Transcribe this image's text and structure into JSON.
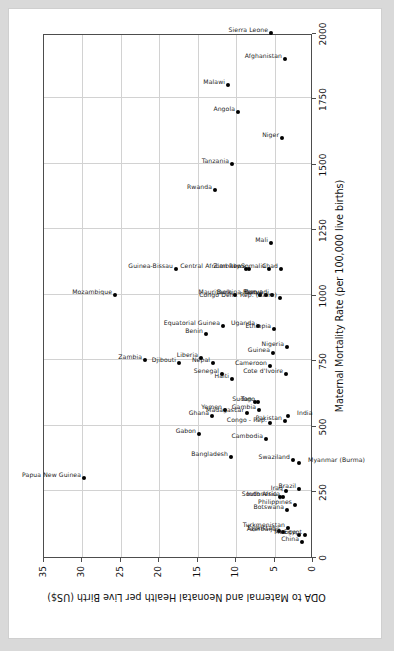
{
  "chart_data": {
    "type": "scatter",
    "title": "",
    "xlabel": "Maternal Mortality Rate (per 100,000 live births)",
    "ylabel": "ODA to Maternal and Neonatal Health per Live Birth (US$)",
    "xlim": [
      0,
      2000
    ],
    "ylim": [
      0,
      35
    ],
    "xticks": [
      0,
      250,
      500,
      750,
      1000,
      1250,
      1500,
      1750,
      2000
    ],
    "yticks": [
      0,
      5,
      10,
      15,
      20,
      25,
      30,
      35
    ],
    "grid": true,
    "legend": "none",
    "marker": "filled-diamond",
    "points": [
      {
        "label": "Papua New Guinea",
        "x": 300,
        "y": 29.8,
        "lpos": "left"
      },
      {
        "label": "Mozambique",
        "x": 1000,
        "y": 25.8,
        "lpos": "left"
      },
      {
        "label": "Zambia",
        "x": 750,
        "y": 21.8,
        "lpos": "left"
      },
      {
        "label": "Guinea-Bissau",
        "x": 1100,
        "y": 17.8,
        "lpos": "left"
      },
      {
        "label": "Djibouti",
        "x": 740,
        "y": 17.5,
        "lpos": "left"
      },
      {
        "label": "Liberia",
        "x": 760,
        "y": 14.6,
        "lpos": "left"
      },
      {
        "label": "Benin",
        "x": 850,
        "y": 13.9,
        "lpos": "left"
      },
      {
        "label": "Nepal",
        "x": 740,
        "y": 13.0,
        "lpos": "left"
      },
      {
        "label": "Equatorial Guinea",
        "x": 880,
        "y": 11.7,
        "lpos": "left"
      },
      {
        "label": "Gabon",
        "x": 470,
        "y": 14.8,
        "lpos": "left"
      },
      {
        "label": "Ghana",
        "x": 540,
        "y": 13.2,
        "lpos": "left"
      },
      {
        "label": "Senegal",
        "x": 700,
        "y": 11.8,
        "lpos": "left"
      },
      {
        "label": "Yemen",
        "x": 560,
        "y": 11.5,
        "lpos": "left"
      },
      {
        "label": "Haiti",
        "x": 680,
        "y": 10.5,
        "lpos": "left"
      },
      {
        "label": "Mauritania",
        "x": 1000,
        "y": 10.1,
        "lpos": "left"
      },
      {
        "label": "Malawi",
        "x": 1800,
        "y": 11.0,
        "lpos": "left"
      },
      {
        "label": "Angola",
        "x": 1700,
        "y": 9.7,
        "lpos": "left"
      },
      {
        "label": "Rwanda",
        "x": 1400,
        "y": 12.8,
        "lpos": "left"
      },
      {
        "label": "Tanzania",
        "x": 1500,
        "y": 10.6,
        "lpos": "left"
      },
      {
        "label": "Bangladesh",
        "x": 380,
        "y": 10.7,
        "lpos": "left"
      },
      {
        "label": "Madagascar",
        "x": 550,
        "y": 8.6,
        "lpos": "left"
      },
      {
        "label": "Sudan",
        "x": 590,
        "y": 7.6,
        "lpos": "left"
      },
      {
        "label": "Gambia",
        "x": 560,
        "y": 7.0,
        "lpos": "left"
      },
      {
        "label": "Togo",
        "x": 590,
        "y": 7.1,
        "lpos": "left"
      },
      {
        "label": "Uganda",
        "x": 880,
        "y": 7.1,
        "lpos": "left"
      },
      {
        "label": "Central African Rep.",
        "x": 1100,
        "y": 8.7,
        "lpos": "left"
      },
      {
        "label": "Zimbabwe",
        "x": 1100,
        "y": 8.3,
        "lpos": "left"
      },
      {
        "label": "Burkina Faso",
        "x": 1000,
        "y": 6.9,
        "lpos": "left"
      },
      {
        "label": "Kenya",
        "x": 1000,
        "y": 6.1,
        "lpos": "left"
      },
      {
        "label": "Cambodia",
        "x": 450,
        "y": 6.1,
        "lpos": "left"
      },
      {
        "label": "Congo - Rep.",
        "x": 510,
        "y": 5.6,
        "lpos": "left"
      },
      {
        "label": "Cameroon",
        "x": 730,
        "y": 5.6,
        "lpos": "left"
      },
      {
        "label": "Guinea",
        "x": 780,
        "y": 5.2,
        "lpos": "left"
      },
      {
        "label": "Mali",
        "x": 1200,
        "y": 5.4,
        "lpos": "left"
      },
      {
        "label": "Somalia",
        "x": 1100,
        "y": 5.7,
        "lpos": "left"
      },
      {
        "label": "Burundi",
        "x": 1000,
        "y": 5.3,
        "lpos": "left"
      },
      {
        "label": "Ethiopia",
        "x": 870,
        "y": 5.1,
        "lpos": "left"
      },
      {
        "label": "Congo Dem. Rep. (Zaire)",
        "x": 990,
        "y": 4.3,
        "lpos": "left"
      },
      {
        "label": "Chad",
        "x": 1100,
        "y": 4.2,
        "lpos": "left"
      },
      {
        "label": "Niger",
        "x": 1600,
        "y": 4.0,
        "lpos": "left"
      },
      {
        "label": "Nigeria",
        "x": 800,
        "y": 3.4,
        "lpos": "left"
      },
      {
        "label": "Cote d'Ivoire",
        "x": 700,
        "y": 3.5,
        "lpos": "left"
      },
      {
        "label": "Pakistan",
        "x": 520,
        "y": 3.6,
        "lpos": "left"
      },
      {
        "label": "India",
        "x": 540,
        "y": 3.2,
        "lpos": "right"
      },
      {
        "label": "Sierra Leone",
        "x": 2000,
        "y": 5.5,
        "lpos": "left"
      },
      {
        "label": "Afghanistan",
        "x": 1900,
        "y": 3.6,
        "lpos": "left"
      },
      {
        "label": "Swaziland",
        "x": 370,
        "y": 2.6,
        "lpos": "left"
      },
      {
        "label": "Myanmar (Burma)",
        "x": 360,
        "y": 1.8,
        "lpos": "right"
      },
      {
        "label": "Tajikistan",
        "x": 100,
        "y": 4.4,
        "lpos": "left"
      },
      {
        "label": "Indonesia",
        "x": 230,
        "y": 4.3,
        "lpos": "left"
      },
      {
        "label": "Azerbaijan",
        "x": 94,
        "y": 3.9,
        "lpos": "left"
      },
      {
        "label": "South Africa",
        "x": 230,
        "y": 3.9,
        "lpos": "left"
      },
      {
        "label": "Iraq",
        "x": 250,
        "y": 3.5,
        "lpos": "left"
      },
      {
        "label": "Turkmenistan",
        "x": 110,
        "y": 3.3,
        "lpos": "left"
      },
      {
        "label": "Botswana",
        "x": 180,
        "y": 3.4,
        "lpos": "left"
      },
      {
        "label": "Philippines",
        "x": 200,
        "y": 2.4,
        "lpos": "left"
      },
      {
        "label": "Brazil",
        "x": 260,
        "y": 1.8,
        "lpos": "left"
      },
      {
        "label": "China",
        "x": 56,
        "y": 1.4,
        "lpos": "left"
      },
      {
        "label": "Mexico",
        "x": 83,
        "y": 1.8,
        "lpos": "left"
      },
      {
        "label": "Egypt",
        "x": 84,
        "y": 1.1,
        "lpos": "left"
      }
    ]
  }
}
